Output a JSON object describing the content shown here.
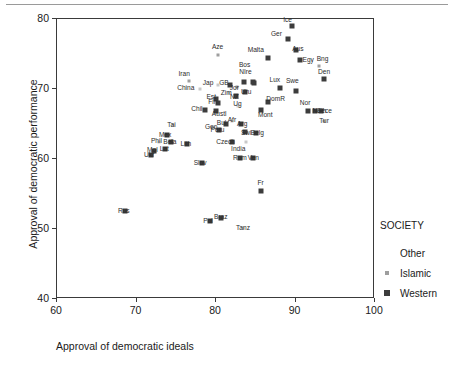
{
  "chart_data": {
    "type": "scatter",
    "title": "",
    "xlabel": "Approval of democratic ideals",
    "ylabel": "Approval of democratic performance",
    "xlim": [
      60,
      100
    ],
    "ylim": [
      40,
      80
    ],
    "xticks": [
      60,
      70,
      80,
      90,
      100
    ],
    "yticks": [
      40,
      50,
      60,
      70,
      80
    ],
    "grid": false,
    "legend": {
      "title": "SOCIETY",
      "position": "right",
      "entries": [
        {
          "label": "Other",
          "marker": "none",
          "color": "#ffffff"
        },
        {
          "label": "Islamic",
          "marker": "small-square",
          "color": "#9e9e9e"
        },
        {
          "label": "Western",
          "marker": "square",
          "color": "#3c3c3c"
        }
      ]
    },
    "points": [
      {
        "label": "Ice",
        "x": 89.6,
        "y": 79.0,
        "group": "Western",
        "lx": 89.0,
        "ly": 79.9
      },
      {
        "label": "Ger",
        "x": 89.0,
        "y": 77.2,
        "group": "Western",
        "lx": 87.6,
        "ly": 77.9
      },
      {
        "label": "Aus",
        "x": 90.0,
        "y": 75.6,
        "group": "Western",
        "lx": 90.3,
        "ly": 75.7
      },
      {
        "label": "Malta",
        "x": 86.6,
        "y": 74.4,
        "group": "Western",
        "lx": 85.0,
        "ly": 75.6
      },
      {
        "label": "Egy",
        "x": 90.6,
        "y": 74.2,
        "group": "Western",
        "lx": 91.6,
        "ly": 74.2
      },
      {
        "label": "Bng",
        "x": 93.0,
        "y": 73.3,
        "group": "Islamic",
        "lx": 93.4,
        "ly": 74.3
      },
      {
        "label": "Den",
        "x": 93.6,
        "y": 71.5,
        "group": "Western",
        "lx": 93.6,
        "ly": 72.5
      },
      {
        "label": "Aze",
        "x": 80.2,
        "y": 74.9,
        "group": "Islamic",
        "lx": 80.2,
        "ly": 76.0
      },
      {
        "label": "Bos",
        "x": 84.6,
        "y": 71.0,
        "group": "Western",
        "lx": 83.6,
        "ly": 73.4
      },
      {
        "label": "NIre",
        "x": 84.8,
        "y": 70.9,
        "group": "Western",
        "lx": 83.7,
        "ly": 72.4
      },
      {
        "label": "Iran",
        "x": 76.6,
        "y": 71.1,
        "group": "Islamic",
        "lx": 76.0,
        "ly": 72.2
      },
      {
        "label": "Lux",
        "x": 88.0,
        "y": 70.2,
        "group": "Western",
        "lx": 87.4,
        "ly": 71.3
      },
      {
        "label": "Swe",
        "x": 90.0,
        "y": 69.7,
        "group": "Western",
        "lx": 89.6,
        "ly": 71.2
      },
      {
        "label": "Jap",
        "x": 80.2,
        "y": 70.6,
        "group": "Other",
        "lx": 79.0,
        "ly": 70.8
      },
      {
        "label": "GB",
        "x": 81.8,
        "y": 70.6,
        "group": "Western",
        "lx": 81.0,
        "ly": 70.8
      },
      {
        "label": "China",
        "x": 78.0,
        "y": 70.0,
        "group": "Other",
        "lx": 76.2,
        "ly": 70.2
      },
      {
        "label": "Jor",
        "x": 82.6,
        "y": 70.3,
        "group": "Islamic",
        "lx": 82.3,
        "ly": 70.2
      },
      {
        "label": "Lat2",
        "x": 83.5,
        "y": 71.0,
        "group": "Western",
        "lx": 83.3,
        "ly": 71.1
      },
      {
        "label": "Uru",
        "x": 83.6,
        "y": 69.6,
        "group": "Western",
        "lx": 83.8,
        "ly": 69.6
      },
      {
        "label": "Zim",
        "x": 81.6,
        "y": 69.5,
        "group": "Other",
        "lx": 81.3,
        "ly": 69.5
      },
      {
        "label": "NZ",
        "x": 82.5,
        "y": 69.0,
        "group": "Western",
        "lx": 82.3,
        "ly": 68.9
      },
      {
        "label": "Est",
        "x": 80.0,
        "y": 68.6,
        "group": "Western",
        "lx": 79.4,
        "ly": 68.8
      },
      {
        "label": "Fin",
        "x": 80.2,
        "y": 68.0,
        "group": "Western",
        "lx": 79.6,
        "ly": 68.1
      },
      {
        "label": "Ug",
        "x": 82.8,
        "y": 67.6,
        "group": "Other",
        "lx": 82.7,
        "ly": 67.9
      },
      {
        "label": "DomR",
        "x": 86.6,
        "y": 68.2,
        "group": "Western",
        "lx": 87.5,
        "ly": 68.6
      },
      {
        "label": "Nor",
        "x": 91.6,
        "y": 66.8,
        "group": "Western",
        "lx": 91.2,
        "ly": 68.0
      },
      {
        "label": "Chil",
        "x": 78.6,
        "y": 67.0,
        "group": "Western",
        "lx": 77.6,
        "ly": 67.2
      },
      {
        "label": "Austl",
        "x": 80.0,
        "y": 66.8,
        "group": "Western",
        "lx": 80.4,
        "ly": 66.5
      },
      {
        "label": "Mont",
        "x": 85.6,
        "y": 67.0,
        "group": "Western",
        "lx": 86.2,
        "ly": 66.3
      },
      {
        "label": "Neth",
        "x": 92.4,
        "y": 66.8,
        "group": "Western",
        "lx": 93.0,
        "ly": 66.8
      },
      {
        "label": "Gece",
        "x": 93.2,
        "y": 66.8,
        "group": "Western",
        "lx": 93.6,
        "ly": 66.8
      },
      {
        "label": "Tur",
        "x": 93.6,
        "y": 65.4,
        "group": "Islamic",
        "lx": 93.6,
        "ly": 65.4
      },
      {
        "label": "Afr",
        "x": 82.0,
        "y": 65.4,
        "group": "Other",
        "lx": 82.0,
        "ly": 65.6
      },
      {
        "label": "Bul",
        "x": 81.2,
        "y": 65.0,
        "group": "Western",
        "lx": 80.7,
        "ly": 65.2
      },
      {
        "label": "Arg",
        "x": 83.2,
        "y": 65.0,
        "group": "Western",
        "lx": 83.3,
        "ly": 65.0
      },
      {
        "label": "Tai",
        "x": 74.6,
        "y": 64.8,
        "group": "Other",
        "lx": 74.4,
        "ly": 64.9
      },
      {
        "label": "Geo",
        "x": 79.8,
        "y": 64.6,
        "group": "Other",
        "lx": 79.4,
        "ly": 64.6
      },
      {
        "label": "Peru",
        "x": 80.4,
        "y": 64.2,
        "group": "Western",
        "lx": 80.2,
        "ly": 64.1
      },
      {
        "label": "Swi",
        "x": 83.6,
        "y": 63.8,
        "group": "Western",
        "lx": 83.8,
        "ly": 63.7
      },
      {
        "label": "Belg",
        "x": 85.0,
        "y": 63.7,
        "group": "Western",
        "lx": 85.2,
        "ly": 63.7
      },
      {
        "label": "Mex",
        "x": 73.8,
        "y": 63.4,
        "group": "Western",
        "lx": 73.6,
        "ly": 63.4
      },
      {
        "label": "Phil",
        "x": 72.8,
        "y": 62.5,
        "group": "Other",
        "lx": 72.5,
        "ly": 62.6
      },
      {
        "label": "Bela",
        "x": 74.4,
        "y": 62.5,
        "group": "Western",
        "lx": 74.2,
        "ly": 62.5
      },
      {
        "label": "Lith",
        "x": 76.4,
        "y": 62.2,
        "group": "Western",
        "lx": 76.2,
        "ly": 62.2
      },
      {
        "label": "Czech",
        "x": 82.0,
        "y": 62.4,
        "group": "Western",
        "lx": 81.2,
        "ly": 62.5
      },
      {
        "label": "India",
        "x": 83.8,
        "y": 62.4,
        "group": "Other",
        "lx": 82.8,
        "ly": 61.4
      },
      {
        "label": "Mol",
        "x": 72.2,
        "y": 61.2,
        "group": "Western",
        "lx": 72.0,
        "ly": 61.3
      },
      {
        "label": "Lat",
        "x": 73.6,
        "y": 61.4,
        "group": "Western",
        "lx": 73.5,
        "ly": 61.5
      },
      {
        "label": "Ukr",
        "x": 71.8,
        "y": 60.6,
        "group": "Western",
        "lx": 71.6,
        "ly": 60.6
      },
      {
        "label": "Rom",
        "x": 83.0,
        "y": 60.2,
        "group": "Western",
        "lx": 83.0,
        "ly": 60.2
      },
      {
        "label": "Ven",
        "x": 84.6,
        "y": 60.2,
        "group": "Western",
        "lx": 84.7,
        "ly": 60.2
      },
      {
        "label": "Slov",
        "x": 78.2,
        "y": 59.4,
        "group": "Western",
        "lx": 78.0,
        "ly": 59.4
      },
      {
        "label": "Fr",
        "x": 85.6,
        "y": 55.4,
        "group": "Western",
        "lx": 85.6,
        "ly": 56.6
      },
      {
        "label": "Rus",
        "x": 68.6,
        "y": 52.6,
        "group": "Western",
        "lx": 68.4,
        "ly": 52.6
      },
      {
        "label": "Pol",
        "x": 79.2,
        "y": 51.2,
        "group": "Western",
        "lx": 79.0,
        "ly": 51.2
      },
      {
        "label": "Braz",
        "x": 80.6,
        "y": 51.6,
        "group": "Western",
        "lx": 80.6,
        "ly": 51.7
      },
      {
        "label": "Tanz",
        "x": 83.4,
        "y": 50.2,
        "group": "Other",
        "lx": 83.4,
        "ly": 50.2
      }
    ]
  }
}
